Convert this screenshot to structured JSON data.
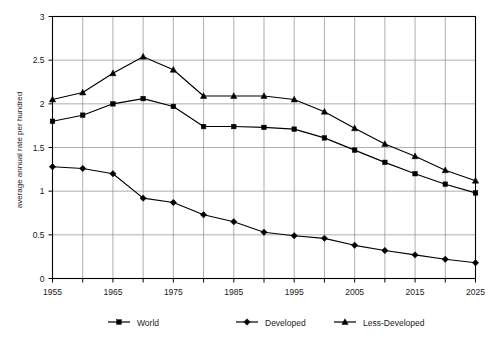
{
  "chart_data": {
    "type": "line",
    "title": "",
    "xlabel": "",
    "ylabel": "average annual rate per hundred",
    "xlim": [
      1955,
      2025
    ],
    "ylim": [
      0,
      3
    ],
    "grid": true,
    "legend_position": "bottom",
    "x": [
      1955,
      1960,
      1965,
      1970,
      1975,
      1980,
      1985,
      1990,
      1995,
      2000,
      2005,
      2010,
      2015,
      2020,
      2025
    ],
    "x_tick_labels": [
      "1955",
      "",
      "1965",
      "",
      "1975",
      "",
      "1985",
      "",
      "1995",
      "",
      "2005",
      "",
      "2015",
      "",
      "2025"
    ],
    "y_tick_labels": [
      "0",
      "0.5",
      "1",
      "1.5",
      "2",
      "2.5",
      "3"
    ],
    "y_ticks": [
      0,
      0.5,
      1,
      1.5,
      2,
      2.5,
      3
    ],
    "series": [
      {
        "name": "World",
        "marker": "square",
        "values": [
          1.8,
          1.87,
          2.0,
          2.06,
          1.97,
          1.74,
          1.74,
          1.73,
          1.71,
          1.61,
          1.47,
          1.33,
          1.2,
          1.08,
          0.98
        ]
      },
      {
        "name": "Developed",
        "marker": "diamond",
        "values": [
          1.28,
          1.26,
          1.2,
          0.92,
          0.87,
          0.73,
          0.65,
          0.53,
          0.49,
          0.46,
          0.38,
          0.32,
          0.27,
          0.22,
          0.18
        ]
      },
      {
        "name": "Less-Developed",
        "marker": "triangle",
        "values": [
          2.05,
          2.13,
          2.35,
          2.54,
          2.39,
          2.09,
          2.09,
          2.09,
          2.05,
          1.91,
          1.72,
          1.54,
          1.4,
          1.24,
          1.12
        ]
      }
    ]
  },
  "legend": {
    "items": [
      {
        "label": "World",
        "marker": "square"
      },
      {
        "label": "Developed",
        "marker": "diamond"
      },
      {
        "label": "Less-Developed",
        "marker": "triangle"
      }
    ]
  },
  "colors": {
    "ink": "#000000",
    "grid": "#8d8d8d",
    "background": "#ffffff"
  }
}
